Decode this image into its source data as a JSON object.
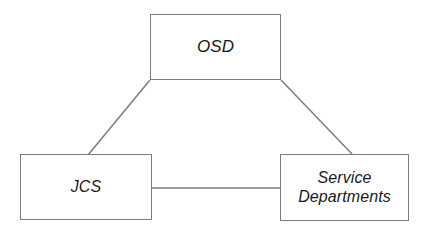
{
  "diagram": {
    "type": "organizational-relationship-triangle",
    "width": 430,
    "height": 237,
    "background_color": "#ffffff",
    "line_color": "#7c7c7c",
    "text_color": "#1a1a1a",
    "nodes": [
      {
        "id": "osd",
        "label": "OSD",
        "x": 150,
        "y": 14,
        "width": 131,
        "height": 66
      },
      {
        "id": "jcs",
        "label": "JCS",
        "x": 20,
        "y": 154,
        "width": 132,
        "height": 66
      },
      {
        "id": "service-departments",
        "label": "Service\nDepartments",
        "x": 280,
        "y": 154,
        "width": 129,
        "height": 67
      }
    ],
    "edges": [
      {
        "id": "osd-to-jcs",
        "from": "osd",
        "to": "jcs",
        "x1": 150,
        "y1": 80,
        "x2": 88,
        "y2": 155
      },
      {
        "id": "osd-to-service-departments",
        "from": "osd",
        "to": "service-departments",
        "x1": 281,
        "y1": 80,
        "x2": 352,
        "y2": 154
      },
      {
        "id": "jcs-to-service-departments",
        "from": "jcs",
        "to": "service-departments",
        "x1": 152,
        "y1": 188,
        "x2": 280,
        "y2": 188
      }
    ]
  }
}
